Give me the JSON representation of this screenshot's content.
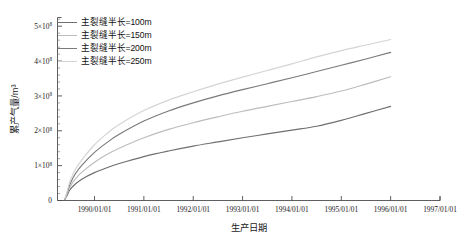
{
  "chart_data": {
    "type": "line",
    "title": "",
    "xlabel": "生产日期",
    "ylabel": "累产气量/m³",
    "grid": false,
    "legend_position": "top-left",
    "x_tick_labels": [
      "1990/01/01",
      "1991/01/01",
      "1992/01/01",
      "1993/01/01",
      "1994/01/01",
      "1995/01/01",
      "1996/01/01",
      "1997/01/01"
    ],
    "x_tick_values": [
      1990.0,
      1991.0,
      1992.0,
      1993.0,
      1994.0,
      1995.0,
      1996.0,
      1997.0
    ],
    "xlim": [
      1989.25,
      1997.0
    ],
    "ylim": [
      0,
      525000000.0
    ],
    "y_tick_labels": [
      "0",
      "1×10⁸",
      "2×10⁸",
      "3×10⁸",
      "4×10⁸",
      "5×10⁸"
    ],
    "y_tick_mantissas": [
      "0",
      "1",
      "2",
      "3",
      "4",
      "5"
    ],
    "y_tick_exponent": "8",
    "y_tick_values": [
      0,
      100000000.0,
      200000000.0,
      300000000.0,
      400000000.0,
      500000000.0
    ],
    "y_minor_count_per_major": 5,
    "x": [
      1989.4,
      1989.45,
      1989.5,
      1989.6,
      1989.75,
      1990.0,
      1990.25,
      1990.5,
      1991.0,
      1991.5,
      1992.0,
      1992.5,
      1993.0,
      1993.5,
      1994.0,
      1994.5,
      1995.0,
      1995.5,
      1996.0
    ],
    "series": [
      {
        "name": "主裂缝半长=100m",
        "color": "#6f6f6f",
        "values": [
          3000000.0,
          16000000.0,
          30000000.0,
          46000000.0,
          62000000.0,
          80000000.0,
          94000000.0,
          106000000.0,
          126000000.0,
          142000000.0,
          156000000.0,
          168000000.0,
          180000000.0,
          191000000.0,
          202000000.0,
          213000000.0,
          230000000.0,
          250000000.0,
          270000000.0
        ]
      },
      {
        "name": "主裂缝半长=150m",
        "color": "#bcbcbc",
        "values": [
          3500000.0,
          20000000.0,
          38000000.0,
          60000000.0,
          82000000.0,
          110000000.0,
          132000000.0,
          150000000.0,
          180000000.0,
          204000000.0,
          223000000.0,
          240000000.0,
          256000000.0,
          270000000.0,
          284000000.0,
          298000000.0,
          314000000.0,
          334000000.0,
          355000000.0
        ]
      },
      {
        "name": "主裂缝半长=200m",
        "color": "#7a7a7a",
        "values": [
          4000000.0,
          24000000.0,
          46000000.0,
          74000000.0,
          102000000.0,
          138000000.0,
          166000000.0,
          190000000.0,
          228000000.0,
          257000000.0,
          280000000.0,
          300000000.0,
          318000000.0,
          335000000.0,
          352000000.0,
          370000000.0,
          388000000.0,
          406000000.0,
          425000000.0
        ]
      },
      {
        "name": "主裂缝半长=250m",
        "color": "#d4d4d4",
        "values": [
          4600000.0,
          28000000.0,
          54000000.0,
          86000000.0,
          118000000.0,
          160000000.0,
          192000000.0,
          218000000.0,
          258000000.0,
          288000000.0,
          312000000.0,
          334000000.0,
          354000000.0,
          373000000.0,
          392000000.0,
          412000000.0,
          430000000.0,
          446000000.0,
          462000000.0
        ]
      }
    ]
  },
  "legend": {
    "items": [
      {
        "label": "主裂缝半长=100m",
        "color": "#6f6f6f"
      },
      {
        "label": "主裂缝半长=150m",
        "color": "#bcbcbc"
      },
      {
        "label": "主裂缝半长=200m",
        "color": "#7a7a7a"
      },
      {
        "label": "主裂缝半长=250m",
        "color": "#d4d4d4"
      }
    ]
  }
}
